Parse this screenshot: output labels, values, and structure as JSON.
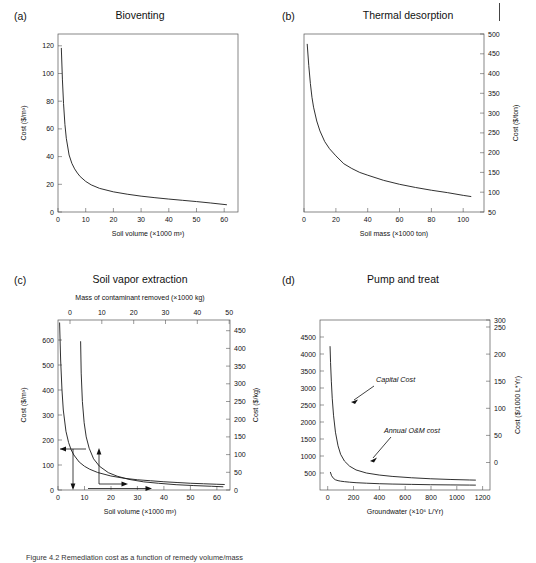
{
  "figure": {
    "page_mark": "page-edge-rule",
    "caption": "Figure 4.2 Remediation cost as a function of remedy volume/mass"
  },
  "panels": [
    {
      "id": "a",
      "letter": "(a)",
      "title": "Bioventing",
      "xlabel": "Soil volume (×1000 m³)",
      "ylabel": "Cost ($/m³)",
      "xticks": [
        "0",
        "10",
        "20",
        "30",
        "40",
        "50",
        "60"
      ],
      "yticks": [
        "0",
        "20",
        "40",
        "60",
        "80",
        "100",
        "120"
      ],
      "y_side": "left"
    },
    {
      "id": "b",
      "letter": "(b)",
      "title": "Thermal desorption",
      "xlabel": "Soil mass (×1000 ton)",
      "ylabel": "Cost ($/ton)",
      "xticks": [
        "0",
        "20",
        "40",
        "60",
        "80",
        "100"
      ],
      "yticks": [
        "50",
        "100",
        "150",
        "200",
        "250",
        "300",
        "350",
        "400",
        "450",
        "500"
      ],
      "y_side": "right"
    },
    {
      "id": "c",
      "letter": "(c)",
      "title": "Soil vapor extraction",
      "supertitle": "Mass of contaminant removed (×1000 kg)",
      "xlabel": "Soil volume (×1000 m³)",
      "ylabel": "Cost ($/m³)",
      "ylabel_right": "Cost ($/kg)",
      "xticks": [
        "0",
        "10",
        "20",
        "30",
        "40",
        "50",
        "60"
      ],
      "topticks": [
        "0",
        "10",
        "20",
        "30",
        "40",
        "50"
      ],
      "yticks": [
        "0",
        "100",
        "200",
        "300",
        "400",
        "500",
        "600"
      ],
      "yticks_right": [
        "0",
        "50",
        "100",
        "150",
        "200",
        "250",
        "300",
        "350",
        "400",
        "450"
      ],
      "y_side": "both"
    },
    {
      "id": "d",
      "letter": "(d)",
      "title": "Pump and treat",
      "xlabel": "Groundwater (×10⁶ L/Yr)",
      "ylabel": "",
      "ylabel_right": "Cost ($/1000 L*Yr)",
      "xticks": [
        "0",
        "200",
        "400",
        "600",
        "800",
        "1000",
        "1200"
      ],
      "yticks": [
        "500",
        "1000",
        "1500",
        "2000",
        "2500",
        "3000",
        "3500",
        "4000",
        "4500"
      ],
      "yticks_right": [
        "0",
        "50",
        "100",
        "150",
        "200",
        "250",
        "300"
      ],
      "y_side": "both",
      "annotations": [
        "Capital Cost",
        "Annual O&M cost"
      ]
    }
  ],
  "chart_data": [
    {
      "type": "line",
      "panel": "a",
      "title": "Bioventing",
      "xlabel": "Soil volume (×1000 m³)",
      "ylabel": "Cost ($/m³)",
      "xlim": [
        0,
        65
      ],
      "ylim": [
        0,
        128
      ],
      "xticks": [
        0,
        10,
        20,
        30,
        40,
        50,
        60
      ],
      "yticks": [
        0,
        20,
        40,
        60,
        80,
        100,
        120
      ],
      "grid": false,
      "legend": "none",
      "series": [
        {
          "name": "Unit cost",
          "x": [
            1.2,
            1.6,
            2,
            2.5,
            3,
            4,
            5,
            6,
            7,
            8,
            10,
            12,
            15,
            20,
            25,
            30,
            35,
            40,
            45,
            50,
            55,
            61
          ],
          "y": [
            118,
            95,
            78,
            63,
            53,
            41,
            35,
            31,
            28,
            25.5,
            22,
            19.5,
            17,
            14.5,
            12.8,
            11.4,
            10.3,
            9.3,
            8.4,
            7.5,
            6.5,
            5.2
          ]
        }
      ]
    },
    {
      "type": "line",
      "panel": "b",
      "title": "Thermal desorption",
      "xlabel": "Soil mass (×1000 ton)",
      "ylabel": "Cost ($/ton)",
      "xlim": [
        0,
        113
      ],
      "ylim": [
        50,
        500
      ],
      "xticks": [
        0,
        20,
        40,
        60,
        80,
        100
      ],
      "yticks": [
        50,
        100,
        150,
        200,
        250,
        300,
        350,
        400,
        450,
        500
      ],
      "grid": false,
      "legend": "none",
      "series": [
        {
          "name": "Unit cost",
          "x": [
            2,
            3,
            4,
            5,
            6,
            8,
            10,
            13,
            16,
            20,
            25,
            30,
            35,
            40,
            50,
            60,
            70,
            80,
            90,
            100,
            105
          ],
          "y": [
            475,
            420,
            375,
            340,
            315,
            280,
            255,
            228,
            210,
            192,
            172,
            160,
            150,
            143,
            130,
            120,
            112,
            105,
            99,
            92,
            89
          ]
        }
      ]
    },
    {
      "type": "line",
      "panel": "c",
      "title": "Soil vapor extraction",
      "supertitle": "Mass of contaminant removed (×1000 kg)",
      "xlabel": "Soil volume (×1000 m³)",
      "ylabel": "Cost ($/m³)",
      "ylabel_right": "Cost ($/kg)",
      "xlim": [
        0,
        65
      ],
      "ylim": [
        0,
        680
      ],
      "xlim_top": [
        0,
        54
      ],
      "ylim_right": [
        0,
        480
      ],
      "xticks": [
        0,
        10,
        20,
        30,
        40,
        50,
        60
      ],
      "xticks_top": [
        0,
        10,
        20,
        30,
        40,
        50
      ],
      "yticks": [
        0,
        100,
        200,
        300,
        400,
        500,
        600
      ],
      "yticks_right": [
        0,
        50,
        100,
        150,
        200,
        250,
        300,
        350,
        400,
        450
      ],
      "grid": false,
      "legend": "none",
      "series": [
        {
          "name": "Cost per soil volume ($/m³)",
          "axis": "left-bottom",
          "x": [
            0.6,
            1,
            1.5,
            2,
            3,
            4,
            5,
            6,
            8,
            10,
            12,
            15,
            20,
            25,
            30,
            35,
            40,
            45,
            50,
            55,
            60,
            63
          ],
          "y": [
            670,
            520,
            400,
            320,
            235,
            190,
            160,
            140,
            112,
            95,
            83,
            70,
            56,
            47,
            41,
            37,
            33,
            30,
            27,
            25,
            23,
            22
          ]
        },
        {
          "name": "Cost per contaminant mass ($/kg)",
          "axis": "right-top",
          "x": [
            3.6,
            3.8,
            4.2,
            4.8,
            5.5,
            6.5,
            8,
            10,
            13,
            16,
            20,
            25,
            30,
            36,
            42,
            48,
            52
          ],
          "y": [
            420,
            330,
            250,
            190,
            150,
            118,
            88,
            67,
            49,
            39,
            30,
            23,
            19,
            15,
            12.5,
            10.5,
            9
          ]
        }
      ]
    },
    {
      "type": "line",
      "panel": "d",
      "title": "Pump and treat",
      "xlabel": "Groundwater (×10⁶ L/Yr)",
      "ylabel_right": "Cost ($/1000 L*Yr)",
      "xlim": [
        -60,
        1260
      ],
      "ylim": [
        0,
        5000
      ],
      "ylim_right": [
        0,
        300
      ],
      "xticks": [
        0,
        200,
        400,
        600,
        800,
        1000,
        1200
      ],
      "yticks": [
        500,
        1000,
        1500,
        2000,
        2500,
        3000,
        3500,
        4000,
        4500
      ],
      "yticks_right": [
        0,
        50,
        100,
        150,
        200,
        250,
        300
      ],
      "grid": false,
      "legend": "annotations",
      "annotations": [
        {
          "text": "Capital Cost",
          "points_to": [
            75,
            2750
          ]
        },
        {
          "text": "Annual O&M cost",
          "points_to": [
            120,
            430
          ]
        }
      ],
      "series": [
        {
          "name": "Capital Cost",
          "x": [
            18,
            22,
            28,
            35,
            45,
            60,
            80,
            100,
            130,
            170,
            220,
            300,
            400,
            500,
            650,
            800,
            950,
            1100,
            1150
          ],
          "y": [
            4230,
            3750,
            3200,
            2700,
            2200,
            1700,
            1300,
            1050,
            850,
            700,
            590,
            500,
            440,
            400,
            360,
            330,
            310,
            295,
            290
          ]
        },
        {
          "name": "Annual O&M cost",
          "x": [
            20,
            30,
            45,
            60,
            80,
            100,
            130,
            170,
            220,
            300,
            400,
            500,
            650,
            800,
            950,
            1100,
            1150
          ],
          "y": [
            530,
            420,
            340,
            300,
            275,
            260,
            245,
            230,
            215,
            200,
            185,
            175,
            165,
            155,
            150,
            145,
            143
          ]
        }
      ]
    }
  ]
}
